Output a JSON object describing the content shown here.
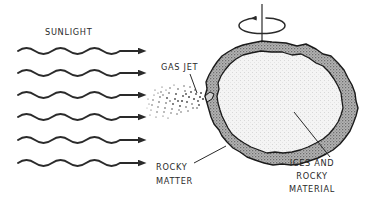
{
  "diagram": {
    "labels": {
      "sunlight": "SUNLIGHT",
      "gas_jet": "GAS JET",
      "rocky_matter_line1": "ROCKY",
      "rocky_matter_line2": "MATTER",
      "ices_line1": "ICES AND",
      "ices_line2": "ROCKY",
      "ices_line3": "MATERIAL"
    },
    "colors": {
      "background": "#ffffff",
      "ink": "#2a2a2a",
      "outline": "#1a1a1a",
      "crust_fill": "#a9a9a9",
      "core_fill": "#f2f2f2",
      "jet_dots": "#4a4a4a"
    },
    "sunlight_rays": {
      "count": 6,
      "wave_cycles": 4,
      "arrowhead": "solid-triangle",
      "direction": "left-to-right"
    },
    "rotation": {
      "axis": "vertical",
      "arrow_direction": "counterclockwise-viewed-from-top"
    },
    "nucleus": {
      "structure": "irregular crust over lighter core",
      "crust_label": "ROCKY MATTER",
      "core_label": "ICES AND ROCKY MATERIAL"
    },
    "gas_jet": {
      "render": "stippled cone",
      "origin": "left surface of nucleus",
      "direction": "toward sunlight"
    }
  }
}
